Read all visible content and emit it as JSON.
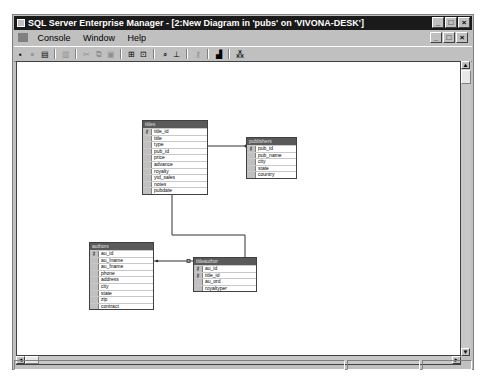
{
  "window": {
    "title": "SQL Server Enterprise Manager - [2:New Diagram in 'pubs' on 'VIVONA-DESK']",
    "caption_buttons": [
      "_",
      "□",
      "×"
    ]
  },
  "menu": {
    "items": [
      "Console",
      "Window",
      "Help"
    ],
    "mdi_buttons": [
      "_",
      "□",
      "×"
    ]
  },
  "toolbar": {
    "buttons": [
      {
        "name": "save-icon",
        "glyph": "▪",
        "enabled": true
      },
      {
        "name": "properties-icon",
        "glyph": "▫",
        "enabled": true
      },
      {
        "name": "print-icon",
        "glyph": "▤",
        "enabled": true
      },
      {
        "name": "sep"
      },
      {
        "name": "print-preview-icon",
        "glyph": "▥",
        "enabled": false
      },
      {
        "name": "sep"
      },
      {
        "name": "cut-icon",
        "glyph": "✂",
        "enabled": false
      },
      {
        "name": "copy-icon",
        "glyph": "⧉",
        "enabled": false
      },
      {
        "name": "paste-icon",
        "glyph": "▣",
        "enabled": false
      },
      {
        "name": "sep"
      },
      {
        "name": "add-table-icon",
        "glyph": "⊞",
        "enabled": true
      },
      {
        "name": "new-table-icon",
        "glyph": "⊡",
        "enabled": true
      },
      {
        "name": "sep"
      },
      {
        "name": "zoom-icon",
        "glyph": "⌕",
        "enabled": true
      },
      {
        "name": "show-relationship-labels-icon",
        "glyph": "⊥",
        "enabled": true
      },
      {
        "name": "sep"
      },
      {
        "name": "set-primary-key-icon",
        "glyph": "⚷",
        "enabled": false
      },
      {
        "name": "sep"
      },
      {
        "name": "table-view-icon",
        "glyph": "▟",
        "enabled": true
      },
      {
        "name": "sep"
      },
      {
        "name": "arrange-tables-icon",
        "glyph": "⁂",
        "enabled": true
      }
    ]
  },
  "diagram": {
    "tables": [
      {
        "name": "titles",
        "x": 125,
        "y": 58,
        "w": 66,
        "columns": [
          {
            "name": "title_id",
            "key": true
          },
          {
            "name": "title",
            "key": false
          },
          {
            "name": "type",
            "key": false
          },
          {
            "name": "pub_id",
            "key": false
          },
          {
            "name": "price",
            "key": false
          },
          {
            "name": "advance",
            "key": false
          },
          {
            "name": "royalty",
            "key": false
          },
          {
            "name": "ytd_sales",
            "key": false
          },
          {
            "name": "notes",
            "key": false
          },
          {
            "name": "pubdate",
            "key": false
          }
        ]
      },
      {
        "name": "publishers",
        "x": 229,
        "y": 75,
        "w": 51,
        "columns": [
          {
            "name": "pub_id",
            "key": true
          },
          {
            "name": "pub_name",
            "key": false
          },
          {
            "name": "city",
            "key": false
          },
          {
            "name": "state",
            "key": false
          },
          {
            "name": "country",
            "key": false
          }
        ]
      },
      {
        "name": "authors",
        "x": 72,
        "y": 180,
        "w": 65,
        "columns": [
          {
            "name": "au_id",
            "key": true
          },
          {
            "name": "au_lname",
            "key": false
          },
          {
            "name": "au_fname",
            "key": false
          },
          {
            "name": "phone",
            "key": false
          },
          {
            "name": "address",
            "key": false
          },
          {
            "name": "city",
            "key": false
          },
          {
            "name": "state",
            "key": false
          },
          {
            "name": "zip",
            "key": false
          },
          {
            "name": "contract",
            "key": false
          }
        ]
      },
      {
        "name": "titleauthor",
        "x": 176,
        "y": 195,
        "w": 64,
        "columns": [
          {
            "name": "au_id",
            "key": true
          },
          {
            "name": "title_id",
            "key": true
          },
          {
            "name": "au_ord",
            "key": false
          },
          {
            "name": "royaltyper",
            "key": false
          }
        ]
      }
    ]
  },
  "scrollbars": {
    "up_arrow": "▲",
    "down_arrow": "▼",
    "left_arrow": "◄",
    "right_arrow": "►"
  },
  "colors": {
    "titlebar": "#1a1a1a",
    "chrome": "#c0c0c0",
    "table_header": "#5a5a5a"
  }
}
